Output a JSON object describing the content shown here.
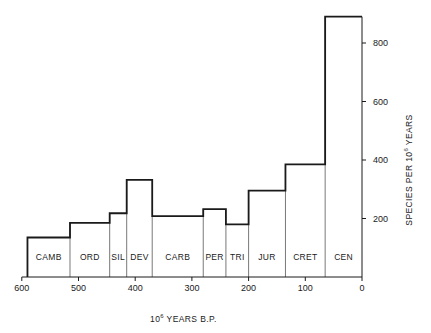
{
  "chart_data": {
    "type": "bar",
    "subtype": "step-histogram",
    "title": "",
    "xlabel": "10^6 YEARS B.P.",
    "ylabel": "SPECIES PER 10^6 YEARS",
    "xlim": [
      600,
      0
    ],
    "ylim": [
      0,
      900
    ],
    "x_ticks": [
      600,
      500,
      400,
      300,
      200,
      100,
      0
    ],
    "y_ticks": [
      200,
      400,
      600,
      800
    ],
    "y_axis_position": "right",
    "grid": false,
    "categories": [
      "CAMB",
      "ORD",
      "SIL",
      "DEV",
      "CARB",
      "PER",
      "TRI",
      "JUR",
      "CRET",
      "CEN"
    ],
    "intervals": [
      {
        "label": "CAMB",
        "start": 590,
        "end": 515,
        "value": 135
      },
      {
        "label": "ORD",
        "start": 515,
        "end": 445,
        "value": 185
      },
      {
        "label": "SIL",
        "start": 445,
        "end": 415,
        "value": 218
      },
      {
        "label": "DEV",
        "start": 415,
        "end": 370,
        "value": 332
      },
      {
        "label": "CARB",
        "start": 370,
        "end": 280,
        "value": 208
      },
      {
        "label": "PER",
        "start": 280,
        "end": 240,
        "value": 232
      },
      {
        "label": "TRI",
        "start": 240,
        "end": 200,
        "value": 180
      },
      {
        "label": "JUR",
        "start": 200,
        "end": 135,
        "value": 295
      },
      {
        "label": "CRET",
        "start": 135,
        "end": 65,
        "value": 385
      },
      {
        "label": "CEN",
        "start": 65,
        "end": 0,
        "value": 890
      }
    ],
    "values": [
      135,
      185,
      218,
      332,
      208,
      232,
      180,
      295,
      385,
      890
    ]
  },
  "labels": {
    "x_axis_title_base": "10",
    "x_axis_title_exp": "6",
    "x_axis_title_rest": " YEARS B.P.",
    "y_axis_title_pre": "SPECIES PER 10",
    "y_axis_title_exp": "6",
    "y_axis_title_rest": " YEARS"
  },
  "colors": {
    "line": "#1a1a1a",
    "divider": "#555555",
    "background": "#ffffff"
  }
}
